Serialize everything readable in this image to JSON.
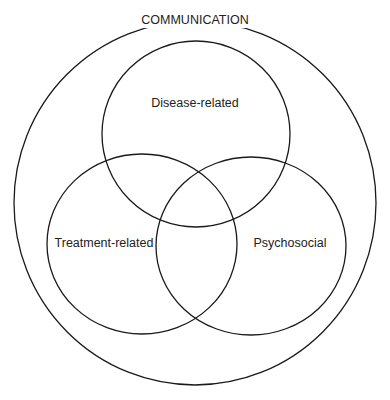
{
  "diagram": {
    "type": "venn",
    "outer": {
      "label": "COMMUNICATION",
      "cx": 195,
      "cy": 203,
      "rx": 181,
      "ry": 182
    },
    "sets": [
      {
        "label": "Disease-related",
        "cx": 196,
        "cy": 134,
        "rx": 94,
        "ry": 93,
        "label_x": 195,
        "label_y": 107
      },
      {
        "label": "Treatment-related",
        "cx": 142,
        "cy": 244,
        "rx": 95,
        "ry": 90,
        "label_x": 108,
        "label_y": 247
      },
      {
        "label": "Psychosocial",
        "cx": 251,
        "cy": 246,
        "rx": 95,
        "ry": 89,
        "label_x": 259,
        "label_y": 247
      }
    ],
    "stroke_color": "#1a1a1a"
  }
}
